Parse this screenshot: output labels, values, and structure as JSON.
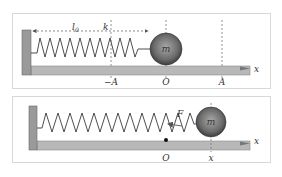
{
  "figure": {
    "panels": [
      {
        "id": "equilibrium",
        "labels": {
          "length": "l",
          "length_sub": "0",
          "spring_constant": "k",
          "mass": "m",
          "neg_amplitude": "−A",
          "origin": "O",
          "amplitude": "A",
          "axis": "x"
        }
      },
      {
        "id": "displaced",
        "labels": {
          "force": "F",
          "mass": "m",
          "origin": "O",
          "position": "x",
          "axis": "x"
        }
      }
    ],
    "colors": {
      "frame": "#d8d8d8",
      "wall": "#9a9a9a",
      "floor": "#b8b8b8",
      "spring": "#3a3a3a",
      "ball_light": "#9a9a9a",
      "ball_dark": "#3c3c3c",
      "dash": "#777777",
      "text": "#333333"
    }
  }
}
